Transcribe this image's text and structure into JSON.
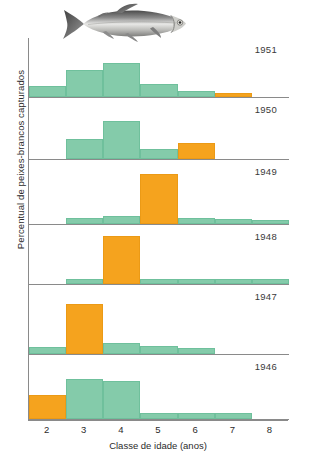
{
  "chart_data": {
    "type": "bar",
    "title": "",
    "xlabel": "Classe de idade (anos)",
    "ylabel": "Percentual de peixes-brancos capturados",
    "categories": [
      2,
      3,
      4,
      5,
      6,
      7,
      8
    ],
    "xlim": [
      1.5,
      8.5
    ],
    "grid": false,
    "legend": null,
    "highlight_color": "#f5a31e",
    "series_color": "#84cbaa",
    "highlight_note": "A barra laranja acompanha a mesma classe anual (coorte de 1944) ao longo dos anos",
    "panels": [
      {
        "year": "1951",
        "ylim": [
          0,
          100
        ],
        "values": [
          18,
          45,
          58,
          22,
          10,
          6,
          0
        ],
        "highlight_index": 5
      },
      {
        "year": "1950",
        "ylim": [
          0,
          100
        ],
        "values": [
          0,
          32,
          62,
          16,
          26,
          0,
          0
        ],
        "highlight_index": 4
      },
      {
        "year": "1949",
        "ylim": [
          0,
          100
        ],
        "values": [
          0,
          9,
          12,
          78,
          9,
          8,
          7
        ],
        "highlight_index": 3
      },
      {
        "year": "1948",
        "ylim": [
          0,
          100
        ],
        "values": [
          0,
          8,
          82,
          9,
          8,
          8,
          8
        ],
        "highlight_index": 2
      },
      {
        "year": "1947",
        "ylim": [
          0,
          100
        ],
        "values": [
          10,
          72,
          16,
          11,
          8,
          0,
          0
        ],
        "highlight_index": 1
      },
      {
        "year": "1946",
        "ylim": [
          0,
          100
        ],
        "values": [
          38,
          62,
          60,
          10,
          9,
          9,
          0
        ],
        "highlight_index": 0
      }
    ]
  },
  "figure": {
    "ylabel": "Percentual de peixes-brancos capturados",
    "xlabel": "Classe de idade (anos)",
    "tick_labels": [
      "2",
      "3",
      "4",
      "5",
      "6",
      "7",
      "8"
    ],
    "year_labels": [
      "1951",
      "1950",
      "1949",
      "1948",
      "1947",
      "1946"
    ],
    "illustration": "whitefish-illustration"
  }
}
